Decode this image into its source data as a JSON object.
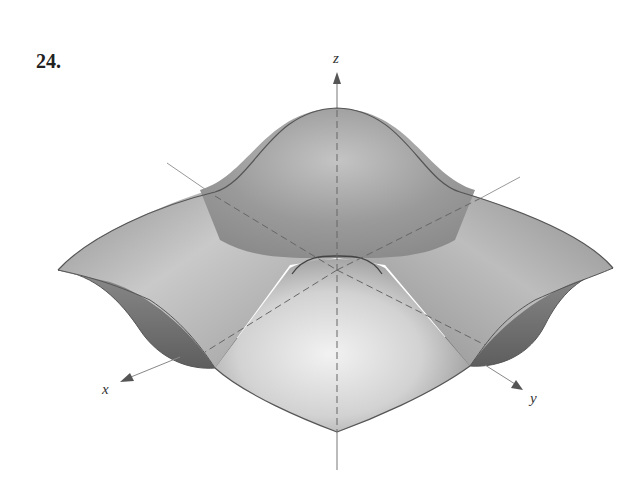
{
  "problem": {
    "number": "24."
  },
  "figure": {
    "axes": {
      "x": {
        "label": "x"
      },
      "y": {
        "label": "y"
      },
      "z": {
        "label": "z"
      }
    },
    "colors": {
      "surface_light": "#e6e6e6",
      "surface_mid": "#a8a8a8",
      "surface_dark": "#707070",
      "edge": "#555555",
      "axis": "#777777"
    }
  }
}
